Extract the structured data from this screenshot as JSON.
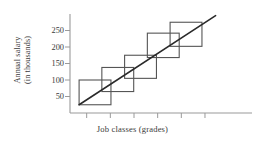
{
  "chart_data": {
    "type": "bar",
    "title": "",
    "subtitle": "",
    "xlabel": "Job classes (grades)",
    "ylabel": "Annual salary (in thousands)",
    "ylabel_line1": "Annual salary",
    "ylabel_line2": "(in thousands)",
    "ytick_labels": [
      "250",
      "200",
      "150",
      "100",
      "50"
    ],
    "ytick_values": [
      250,
      200,
      150,
      100,
      50
    ],
    "ylim": [
      0,
      300
    ],
    "xtick_labels": [
      "",
      "",
      "",
      "",
      "",
      ""
    ],
    "xtick_count": 6,
    "xlim": [
      0,
      6
    ],
    "grid": false,
    "legend": null,
    "annotations": [],
    "series": [
      {
        "name": "Pay grade ranges",
        "type": "range-boxes",
        "description": "Overlapping salary range boxes per job grade",
        "boxes": [
          {
            "grade": 1,
            "x_start": 0.3,
            "x_end": 1.35,
            "salary_min": 25,
            "salary_max": 100
          },
          {
            "grade": 2,
            "x_start": 1.05,
            "x_end": 2.1,
            "salary_min": 65,
            "salary_max": 138
          },
          {
            "grade": 3,
            "x_start": 1.8,
            "x_end": 2.85,
            "salary_min": 105,
            "salary_max": 175
          },
          {
            "grade": 4,
            "x_start": 2.55,
            "x_end": 3.6,
            "salary_min": 168,
            "salary_max": 242
          },
          {
            "grade": 5,
            "x_start": 3.3,
            "x_end": 4.35,
            "salary_min": 202,
            "salary_max": 275
          }
        ]
      },
      {
        "name": "Pay policy line",
        "type": "line",
        "description": "Straight trend line through the midpoints of the grade ranges",
        "x": [
          0.3,
          4.8
        ],
        "y": [
          25,
          295
        ]
      }
    ]
  },
  "colors": {
    "box_stroke": "#555555",
    "line_stroke": "#2a2a2a",
    "axis": "#9a9a9a",
    "text": "#3b3b3b",
    "background": "#ffffff"
  }
}
